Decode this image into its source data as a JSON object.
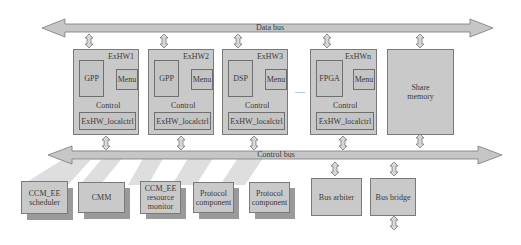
{
  "buses": {
    "data_bus": "Data bus",
    "control_bus": "Control bus"
  },
  "exhw_modules": [
    {
      "title": "ExHW1",
      "processor": "GPP",
      "memory": "Menu",
      "control": "Control",
      "localctrl": "ExHW_localctrl"
    },
    {
      "title": "ExHW2",
      "processor": "GPP",
      "memory": "Menu",
      "control": "Control",
      "localctrl": "ExHW_localctrl"
    },
    {
      "title": "ExHW3",
      "processor": "DSP",
      "memory": "Menu",
      "control": "Control",
      "localctrl": "ExHW_localctrl"
    },
    {
      "title": "ExHWn",
      "processor": "FPGA",
      "memory": "Menu",
      "control": "Control",
      "localctrl": "ExHW_localctrl"
    }
  ],
  "ellipsis": ".....",
  "share_memory": {
    "line1": "Share",
    "line2": "memory"
  },
  "bottom_components": [
    {
      "line1": "CCM_EE",
      "line2": "scheduler",
      "line3": ""
    },
    {
      "line1": "CMM",
      "line2": "",
      "line3": ""
    },
    {
      "line1": "CCM_EE",
      "line2": "resource",
      "line3": "monitor"
    },
    {
      "line1": "Protocol",
      "line2": "component",
      "line3": ""
    },
    {
      "line1": "Protocol",
      "line2": "component",
      "line3": ""
    }
  ],
  "bus_arbiter": "Bus arbiter",
  "bus_bridge": "Bus bridge",
  "colors": {
    "bus_fill": "#c6c6c6",
    "box_fill": "#c9c9c9",
    "border": "#777777",
    "shadow_band": "#dcdcdc",
    "drop_shadow": "#9a9a9a"
  }
}
